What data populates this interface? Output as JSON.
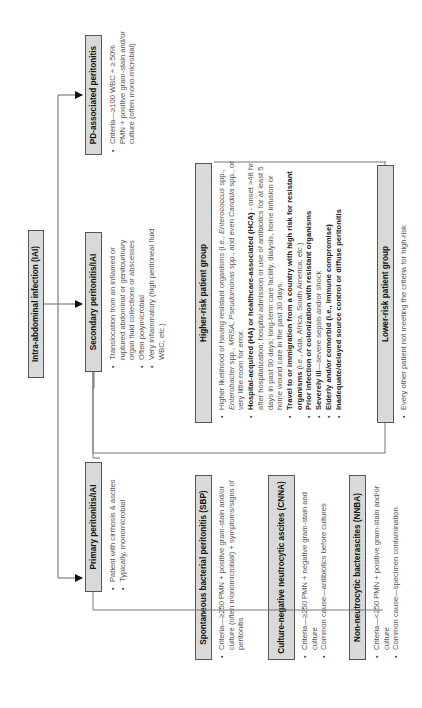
{
  "diagram": {
    "orientation": "rotated -90deg (text reads bottom-to-top)",
    "root": {
      "label": "Intra-abdominal infection (IAI)"
    },
    "categories": [
      {
        "label": "Primary peritonitis/IAI",
        "bullets": [
          "Patient with cirrhosis & ascites",
          "Typically, monomicrobial"
        ],
        "children": [
          {
            "label": "Spontaneous bacterial peritonitis (SBP)",
            "bullets": [
              "Criteria—≥250 PMN + positive gram-stain and/or culture (often monomicrobial) + symptoms/signs of peritonitis"
            ]
          },
          {
            "label": "Culture-negative neutrocytic ascites (CNNA)",
            "bullets": [
              "Criteria—≥250 PMN + negative gram-stain and culture",
              "Common cause—antibiotics before cultures"
            ]
          },
          {
            "label": "Non-neutrocytic bacterascites (NNBA)",
            "bullets": [
              "Criteria—<250 PMN + positive gram-stain and/or culture",
              "Common cause—specimen contamination"
            ]
          }
        ]
      },
      {
        "label": "Secondary peritonitis/IAI",
        "bullets": [
          "Translocation from an inflamed or ruptured abdominal or genitourinary organ fluid collections or abscesses",
          "Often polymicrobial",
          "Very inflammatory (high peritoneal fluid WBC, etc.)"
        ],
        "children": [
          {
            "label": "Higher-risk patient group",
            "bullets": [
              {
                "parts": [
                  {
                    "t": "Higher likelihood of having resistant organisms (i.e., "
                  },
                  {
                    "t": "Enterococcus",
                    "i": true
                  },
                  {
                    "t": " spp., "
                  },
                  {
                    "t": "Enterobacter",
                    "i": true
                  },
                  {
                    "t": " spp., "
                  },
                  {
                    "t": "MRSA",
                    "i": true
                  },
                  {
                    "t": ", "
                  },
                  {
                    "t": "Pseudomonas",
                    "i": true
                  },
                  {
                    "t": " spp., and even "
                  },
                  {
                    "t": "Candida",
                    "i": true
                  },
                  {
                    "t": " spp., or very little room for error."
                  }
                ]
              },
              {
                "parts": [
                  {
                    "t": "Hospital-acquired (HA) or healthcare-associated (HCA)",
                    "b": true
                  },
                  {
                    "t": " - onset >48 hr. after hospitalization; hospital admission or use of antibiotics for at least 5 days in past 90 days; long-term care facility, dialysis, home infusion or home wound care in the past 30 days."
                  }
                ]
              },
              {
                "parts": [
                  {
                    "t": "Travel to or immigration from a country with high risk for resistant organisms",
                    "b": true
                  },
                  {
                    "t": " (i.e., Asia, Africa, South America, etc.)"
                  }
                ]
              },
              {
                "parts": [
                  {
                    "t": "Prior infection or colonization with resistant organisms",
                    "b": true
                  }
                ]
              },
              {
                "parts": [
                  {
                    "t": "Severely ill",
                    "b": true
                  },
                  {
                    "t": "—severe sepsis and/or shock"
                  }
                ]
              },
              {
                "parts": [
                  {
                    "t": "Elderly and/or comorbid (i.e., immune compromise)",
                    "b": true
                  }
                ]
              },
              {
                "parts": [
                  {
                    "t": "Inadequate/delayed source control or diffuse peritonitis",
                    "b": true
                  }
                ]
              }
            ]
          },
          {
            "label": "Lower-risk patient group",
            "bullets": [
              "Every other patient not meeting the criteria for high-risk"
            ]
          }
        ]
      },
      {
        "label": "PD-associated peritonitis",
        "bullets": [
          "Criteria—≥100 WBC + ≥ 50% PMN + positive gram-stain and/or culture (often mono-microbial)"
        ]
      }
    ]
  }
}
